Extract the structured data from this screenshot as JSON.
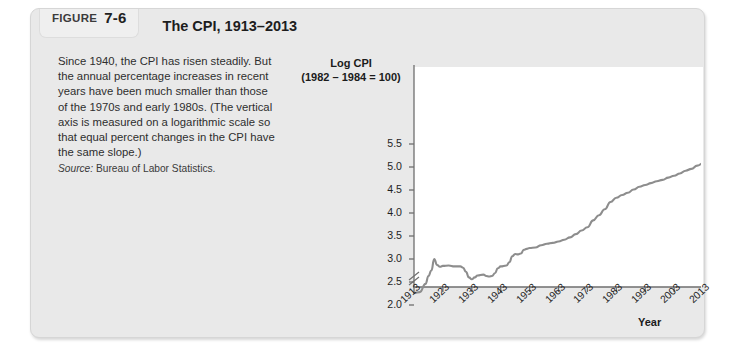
{
  "figure": {
    "label_word": "FIGURE",
    "number": "7-6",
    "title": "The CPI, 1913–2013"
  },
  "caption": {
    "body": "Since 1940, the CPI has risen steadily. But the annual percentage increases in recent years have been much smaller than those of the 1970s and early 1980s. (The vertical axis is measured on a logarithmic scale so that equal percent changes in the CPI have the same slope.)",
    "source_label": "Source:",
    "source_value": "Bureau of Labor Statistics."
  },
  "chart_data": {
    "type": "line",
    "title": "The CPI, 1913–2013",
    "ylabel": "Log CPI (1982 – 1984 = 100)",
    "ylabel_line1": "Log CPI",
    "ylabel_line2": "(1982 – 1984 = 100)",
    "xlabel": "Year",
    "xlim": [
      1913,
      2013
    ],
    "ylim": [
      1.85,
      5.75
    ],
    "grid": false,
    "legend": false,
    "axis_break": true,
    "line_color": "#8d8d8d",
    "yticks": [
      "2.0",
      "2.5",
      "3.0",
      "3.5",
      "4.0",
      "4.5",
      "5.0",
      "5.5"
    ],
    "ytick_values": [
      2.0,
      2.5,
      3.0,
      3.5,
      4.0,
      4.5,
      5.0,
      5.5
    ],
    "xticks": [
      "1913",
      "1923",
      "1933",
      "1943",
      "1953",
      "1963",
      "1973",
      "1983",
      "1993",
      "2003",
      "2013"
    ],
    "xtick_values": [
      1913,
      1923,
      1933,
      1943,
      1953,
      1963,
      1973,
      1983,
      1993,
      2003,
      2013
    ],
    "series": [
      {
        "name": "Log CPI",
        "x": [
          1913,
          1915,
          1917,
          1918,
          1919,
          1920,
          1921,
          1922,
          1923,
          1925,
          1927,
          1929,
          1930,
          1931,
          1932,
          1933,
          1934,
          1935,
          1937,
          1938,
          1939,
          1940,
          1941,
          1942,
          1943,
          1945,
          1946,
          1947,
          1948,
          1949,
          1950,
          1951,
          1952,
          1953,
          1955,
          1957,
          1959,
          1961,
          1963,
          1965,
          1967,
          1969,
          1971,
          1973,
          1975,
          1977,
          1979,
          1981,
          1983,
          1985,
          1987,
          1989,
          1991,
          1993,
          1995,
          1997,
          1999,
          2001,
          2003,
          2005,
          2007,
          2009,
          2011,
          2013
        ],
        "values": [
          2.26,
          2.28,
          2.46,
          2.63,
          2.75,
          3.0,
          2.87,
          2.83,
          2.85,
          2.86,
          2.84,
          2.84,
          2.81,
          2.72,
          2.6,
          2.56,
          2.6,
          2.64,
          2.66,
          2.63,
          2.62,
          2.63,
          2.69,
          2.8,
          2.84,
          2.86,
          2.93,
          3.06,
          3.11,
          3.1,
          3.12,
          3.2,
          3.22,
          3.24,
          3.25,
          3.3,
          3.33,
          3.35,
          3.38,
          3.42,
          3.47,
          3.54,
          3.62,
          3.69,
          3.84,
          3.95,
          4.08,
          4.24,
          4.33,
          4.39,
          4.44,
          4.51,
          4.57,
          4.61,
          4.65,
          4.69,
          4.72,
          4.77,
          4.81,
          4.86,
          4.92,
          4.96,
          5.03,
          5.08
        ]
      }
    ]
  },
  "yticks_layout": [
    {
      "label": "5.5",
      "y": 97
    },
    {
      "label": "5.0",
      "y": 120
    },
    {
      "label": "4.5",
      "y": 143
    },
    {
      "label": "4.0",
      "y": 166
    },
    {
      "label": "3.5",
      "y": 189
    },
    {
      "label": "3.0",
      "y": 212
    },
    {
      "label": "2.5",
      "y": 235
    },
    {
      "label": "2.0",
      "y": 258
    }
  ],
  "xticks_layout": [
    {
      "label": "1913",
      "x": 0
    },
    {
      "label": "1923",
      "x": 28.9
    },
    {
      "label": "1933",
      "x": 57.8
    },
    {
      "label": "1943",
      "x": 86.7
    },
    {
      "label": "1953",
      "x": 115.6
    },
    {
      "label": "1963",
      "x": 144.5
    },
    {
      "label": "1973",
      "x": 173.4
    },
    {
      "label": "1983",
      "x": 202.3
    },
    {
      "label": "1993",
      "x": 231.2
    },
    {
      "label": "2003",
      "x": 260.1
    },
    {
      "label": "2013",
      "x": 289
    }
  ]
}
